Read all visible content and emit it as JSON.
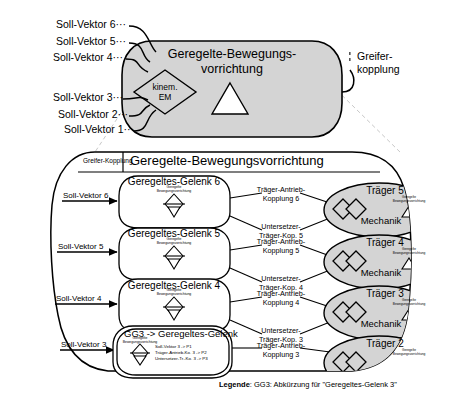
{
  "top": {
    "title_line1": "Geregelte-Bewegungs-",
    "title_line2": "vorrichtung",
    "diamond_line1": "kinem.",
    "diamond_line2": "EM",
    "right_label_line1": "Greifer-",
    "right_label_line2": "kopplung",
    "inputs": [
      "Soll-Vektor 6",
      "Soll-Vektor 5",
      "Soll-Vektor 4",
      "Soll-Vektor 3",
      "Soll-Vektor 2",
      "Soll-Vektor 1"
    ],
    "dots": "···"
  },
  "bottom": {
    "header_left": "Greifer-Kopplung",
    "header_title": "Geregelte-Bewegungsvorrichtung",
    "micro_line1": "Geregelte",
    "micro_line2": "Bewegungsvorrichtung",
    "inputs": [
      "Soll-Vektor 6",
      "Soll-Vektor 5",
      "Soll-Vektor 4",
      "Soll-Vektor 3"
    ],
    "joints": [
      "Geregeltes-Gelenk 6",
      "Geregeltes-Gelenk 5",
      "Geregeltes-Gelenk 4"
    ],
    "gg3": {
      "title": "GG3 -> Geregeltes-Gelenk",
      "mappings": [
        "Soll-Vektor 3 -> P1",
        "Träger-Antrieb-Ko. 3 -> P2",
        "Untersetzer-Tr.-Ko. 3 -> P3"
      ]
    },
    "couplings": [
      {
        "line1": "Träger-Antrieb-",
        "line2": "Kopplung 6"
      },
      {
        "line1": "Untersetzer-",
        "line2": "Träger-Kop. 5"
      },
      {
        "line1": "Träger-Antrieb-",
        "line2": "Kopplung 5"
      },
      {
        "line1": "Untersetzer-",
        "line2": "Träger-Kop. 4"
      },
      {
        "line1": "Träger-Antrieb-",
        "line2": "Kopplung 4"
      },
      {
        "line1": "Untersetzer-",
        "line2": "Träger-Kop. 3"
      },
      {
        "line1": "Träger-Antrieb-",
        "line2": "Kopplung 3"
      }
    ],
    "carriers": [
      {
        "title": "Träger 5",
        "sub": "Mechanik"
      },
      {
        "title": "Träger 4",
        "sub": "Mechanik"
      },
      {
        "title": "Träger 3",
        "sub": "Mechanik"
      },
      {
        "title": "Träger 2",
        "sub": ""
      }
    ]
  },
  "legend": {
    "label": "Legende",
    "text": ": GG3: Abkürzung für \"Geregeltes-Gelenk 3\""
  },
  "colors": {
    "shape_fill": "#d4d4d4",
    "white": "#ffffff",
    "stroke": "#000000",
    "dashed": "#c8c8c8"
  }
}
